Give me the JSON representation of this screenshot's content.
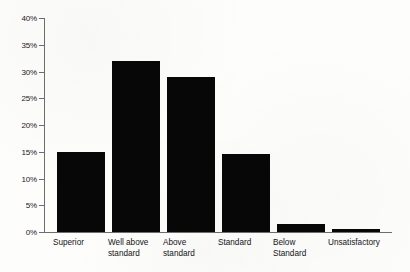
{
  "chart_data": {
    "type": "bar",
    "title": "",
    "subtitle": "",
    "xlabel": "",
    "ylabel": "",
    "categories": [
      "Superior",
      "Well above\nstandard",
      "Above\nstandard",
      "Standard",
      "Below\nStandard",
      "Unsatisfactory"
    ],
    "values": [
      15,
      32,
      29,
      14.5,
      1.5,
      0.5
    ],
    "value_labels": [
      "15%",
      "32%",
      "29%",
      "14.5%",
      "1.5%",
      "0.5%"
    ],
    "ylim": [
      0,
      40
    ],
    "y_ticks": [
      0,
      5,
      10,
      15,
      20,
      25,
      30,
      35,
      40
    ],
    "y_tick_labels": [
      "0%",
      "5%",
      "10%",
      "15%",
      "20%",
      "25%",
      "30%",
      "35%",
      "40%"
    ],
    "grid": false,
    "legend": null,
    "legend_position": "none",
    "bar_color": "#070707",
    "axis_color": "#6e6e6e",
    "background_color": "#fdfdfc"
  }
}
